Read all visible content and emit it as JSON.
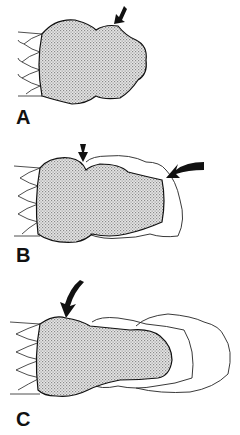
{
  "figure": {
    "panels": [
      {
        "id": "A",
        "label": "A",
        "description": "Shaded tip with single arrow at top-right bulge"
      },
      {
        "id": "B",
        "label": "B",
        "description": "Shaded tip with constriction arrow and curved arrow at tip; outer outline"
      },
      {
        "id": "C",
        "label": "C",
        "description": "Shaded tip with curved arrow at top; two outer outlines"
      }
    ],
    "colors": {
      "stroke": "#111111",
      "fill_pattern": "#9a9a9a",
      "background": "#ffffff"
    }
  }
}
